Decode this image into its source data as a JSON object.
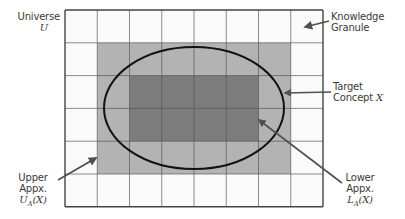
{
  "diagram": {
    "colors": {
      "background": "#ffffff",
      "grid_line": "#555555",
      "cell_fill": "#fafafa",
      "upper_fill": "#b3b3b3",
      "lower_fill": "#7c7c7c",
      "ellipse_stroke": "#111111",
      "arrow": "#505050",
      "text": "#3a3a3a"
    },
    "grid": {
      "columns": 8,
      "rows": 6,
      "x0": 65,
      "y0": 10,
      "cell_w": 32.25,
      "cell_h": 32.8
    },
    "regions": {
      "upper_approximation": {
        "col_start": 1,
        "col_end": 6,
        "row_start": 1,
        "row_end": 4
      },
      "lower_approximation": {
        "col_start": 2,
        "col_end": 5,
        "row_start": 2,
        "row_end": 3
      }
    },
    "target_concept_ellipse": {
      "cx": 194,
      "cy": 108,
      "rx": 90,
      "ry": 61
    },
    "labels": {
      "universe": {
        "line1": "Universe",
        "line2": "U"
      },
      "knowledge_granule": {
        "line1": "Knowledge",
        "line2": "Granule"
      },
      "target_concept": {
        "line1": "Target",
        "line2_prefix": "Concept ",
        "line2_var": "X"
      },
      "upper_appx": {
        "line1": "Upper",
        "line2": "Appx.",
        "line3": "U",
        "line3_sub": "A",
        "line3_arg": "(X)"
      },
      "lower_appx": {
        "line1": "Lower",
        "line2": "Appx.",
        "line3": "L",
        "line3_sub": "A",
        "line3_arg": "(X)"
      }
    }
  }
}
